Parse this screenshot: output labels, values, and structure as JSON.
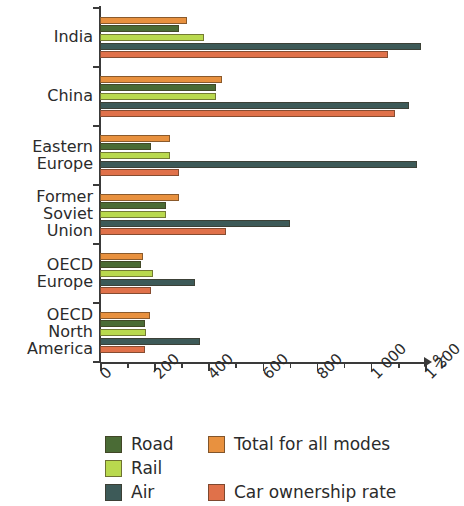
{
  "chart_data": {
    "type": "bar",
    "orientation": "horizontal",
    "title": "",
    "xlabel": "%",
    "ylabel": "",
    "xlim": [
      0,
      1200
    ],
    "xticks": [
      0,
      200,
      400,
      600,
      800,
      1000,
      1200
    ],
    "xtick_labels": [
      "0",
      "200",
      "400",
      "600",
      "800",
      "1 000",
      "1 200"
    ],
    "minor_tick_step": 100,
    "grid": false,
    "legend_position": "below",
    "categories": [
      "India",
      "China",
      "Eastern Europe",
      "Former Soviet Union",
      "OECD Europe",
      "OECD North America"
    ],
    "category_label_lines": [
      [
        "India"
      ],
      [
        "China"
      ],
      [
        "Eastern",
        "Europe"
      ],
      [
        "Former",
        "Soviet",
        "Union"
      ],
      [
        "OECD",
        "Europe"
      ],
      [
        "OECD",
        "North",
        "America"
      ]
    ],
    "series": [
      {
        "name": "Total for all modes",
        "color": "#e8913f",
        "values": [
          320,
          450,
          260,
          290,
          160,
          185
        ]
      },
      {
        "name": "Road",
        "color": "#4a6b35",
        "values": [
          290,
          430,
          190,
          245,
          150,
          165
        ]
      },
      {
        "name": "Rail",
        "color": "#b9d94e",
        "values": [
          385,
          430,
          260,
          245,
          195,
          170
        ]
      },
      {
        "name": "Air",
        "color": "#3d5a58",
        "values": [
          1185,
          1140,
          1170,
          700,
          350,
          370
        ]
      },
      {
        "name": "Car ownership rate",
        "color": "#e0714a",
        "values": [
          1065,
          1090,
          290,
          465,
          190,
          165
        ]
      }
    ]
  },
  "legend": {
    "items": [
      {
        "label": "Road",
        "color": "#4a6b35"
      },
      {
        "label": "Rail",
        "color": "#b9d94e"
      },
      {
        "label": "Air",
        "color": "#3d5a58"
      },
      {
        "label": "Total for all modes",
        "color": "#e8913f"
      },
      {
        "label": "Car ownership rate",
        "color": "#e0714a"
      }
    ]
  },
  "axis": {
    "unit_symbol": "%"
  }
}
